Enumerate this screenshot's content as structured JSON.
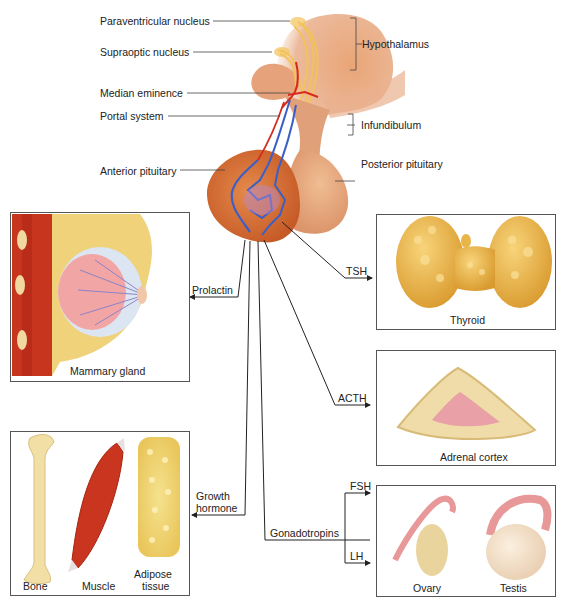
{
  "brain_labels": {
    "paraventricular": "Paraventricular nucleus",
    "supraoptic": "Supraoptic nucleus",
    "hypothalamus": "Hypothalamus",
    "median_eminence": "Median eminence",
    "portal_system": "Portal system",
    "infundibulum": "Infundibulum",
    "anterior_pituitary": "Anterior pituitary",
    "posterior_pituitary": "Posterior pituitary"
  },
  "hormones": {
    "prolactin": "Prolactin",
    "tsh": "TSH",
    "acth": "ACTH",
    "growth_hormone_1": "Growth",
    "growth_hormone_2": "hormone",
    "gonadotropins": "Gonadotropins",
    "fsh": "FSH",
    "lh": "LH"
  },
  "targets": {
    "mammary": "Mammary gland",
    "thyroid": "Thyroid",
    "adrenal": "Adrenal cortex",
    "bone": "Bone",
    "muscle": "Muscle",
    "adipose_1": "Adipose",
    "adipose_2": "tissue",
    "ovary": "Ovary",
    "testis": "Testis"
  },
  "colors": {
    "tissue": "#e0915f",
    "pituitary": "#d9763f",
    "artery": "#d62a1e",
    "vein": "#3a5fc8",
    "neuron": "#f2c35a",
    "thyroid": "#e8b548",
    "adrenal_cortex": "#efdca8",
    "adrenal_medulla": "#e9a0a6",
    "bone": "#f1dfa6",
    "muscle": "#c9351f",
    "adipose": "#f1d777"
  }
}
